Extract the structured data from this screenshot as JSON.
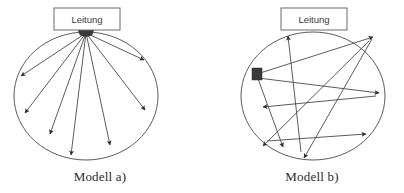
{
  "figure": {
    "width": 404,
    "height": 193,
    "background": "#ffffff",
    "line_color": "#4a4a4a",
    "arrow_color": "#2e2e2e",
    "circle_color": "#5c5c5c",
    "text_color": "#2b2b2b"
  },
  "panels": [
    {
      "id": "model-a",
      "caption": "Modell a)",
      "caption_x": 100,
      "caption_y": 181,
      "node_box": {
        "label": "Leitung",
        "x": 54,
        "y": 8,
        "width": 66,
        "height": 22,
        "label_x": 87,
        "label_y": 22
      },
      "circle": {
        "cx": 86,
        "cy": 96,
        "rx": 72,
        "ry": 64
      },
      "hub": {
        "x": 86,
        "y": 30,
        "rx": 8,
        "ry": 5
      },
      "arrows": [
        {
          "x1": 86,
          "y1": 33,
          "x2": 20,
          "y2": 75
        },
        {
          "x1": 86,
          "y1": 33,
          "x2": 24,
          "y2": 113
        },
        {
          "x1": 86,
          "y1": 33,
          "x2": 49,
          "y2": 134
        },
        {
          "x1": 86,
          "y1": 33,
          "x2": 70,
          "y2": 155
        },
        {
          "x1": 86,
          "y1": 33,
          "x2": 110,
          "y2": 145
        },
        {
          "x1": 86,
          "y1": 33,
          "x2": 145,
          "y2": 110
        },
        {
          "x1": 86,
          "y1": 33,
          "x2": 145,
          "y2": 60
        }
      ]
    },
    {
      "id": "model-b",
      "caption": "Modell b)",
      "caption_x": 312,
      "caption_y": 181,
      "node_box": {
        "label": "Leitung",
        "x": 281,
        "y": 8,
        "width": 66,
        "height": 22,
        "label_x": 314,
        "label_y": 22
      },
      "circle": {
        "cx": 313,
        "cy": 96,
        "rx": 72,
        "ry": 64
      },
      "hub": {
        "x": 256,
        "y": 74,
        "rx": 6,
        "ry": 6
      },
      "arrows": [
        {
          "x1": 300,
          "y1": 152,
          "x2": 288,
          "y2": 36
        },
        {
          "x1": 256,
          "y1": 74,
          "x2": 373,
          "y2": 36
        },
        {
          "x1": 373,
          "y1": 38,
          "x2": 305,
          "y2": 157
        },
        {
          "x1": 256,
          "y1": 74,
          "x2": 283,
          "y2": 147
        },
        {
          "x1": 370,
          "y1": 40,
          "x2": 264,
          "y2": 145
        },
        {
          "x1": 256,
          "y1": 76,
          "x2": 378,
          "y2": 92
        },
        {
          "x1": 376,
          "y1": 95,
          "x2": 264,
          "y2": 107
        },
        {
          "x1": 268,
          "y1": 140,
          "x2": 365,
          "y2": 135
        }
      ]
    }
  ]
}
